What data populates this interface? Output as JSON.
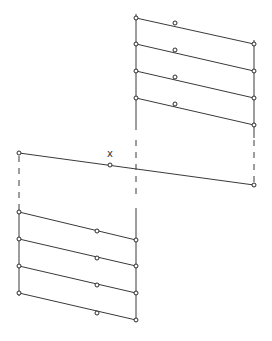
{
  "diagram": {
    "label_x": "x",
    "top_block": {
      "left_x": 136,
      "right_x": 254,
      "mid_x": 175,
      "rows": [
        {
          "left_y": 18,
          "mid_y": 23,
          "right_y": 44
        },
        {
          "left_y": 44,
          "mid_y": 50,
          "right_y": 71
        },
        {
          "left_y": 71,
          "mid_y": 77,
          "right_y": 98
        },
        {
          "left_y": 98,
          "mid_y": 104,
          "right_y": 125
        }
      ]
    },
    "middle_line": {
      "left": [
        19,
        153
      ],
      "mid": [
        110,
        165
      ],
      "right": [
        254,
        185
      ]
    },
    "bottom_block": {
      "left_x": 19,
      "right_x": 136,
      "mid_x": 97,
      "rows": [
        {
          "left_y": 212,
          "mid_y": 231,
          "right_y": 240
        },
        {
          "left_y": 239,
          "mid_y": 258,
          "right_y": 266
        },
        {
          "left_y": 266,
          "mid_y": 285,
          "right_y": 293
        },
        {
          "left_y": 293,
          "mid_y": 313,
          "right_y": 320
        }
      ]
    }
  }
}
